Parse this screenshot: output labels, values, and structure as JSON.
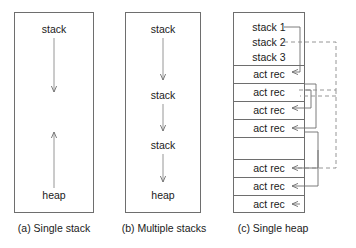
{
  "figure": {
    "background": "#ffffff",
    "line_color": "#6e6e6e",
    "text_color": "#1a1a1a"
  },
  "panels": [
    {
      "id": "a",
      "caption": "(a) Single stack",
      "labels": [
        {
          "name": "stack-label-a1",
          "text": "stack"
        },
        {
          "name": "heap-label-a",
          "text": "heap"
        }
      ],
      "arrows": [
        {
          "name": "arrow-stack-down",
          "direction": "down"
        },
        {
          "name": "arrow-heap-up",
          "direction": "up"
        }
      ]
    },
    {
      "id": "b",
      "caption": "(b) Multiple stacks",
      "labels": [
        {
          "name": "stack-label-b1",
          "text": "stack"
        },
        {
          "name": "stack-label-b2",
          "text": "stack"
        },
        {
          "name": "stack-label-b3",
          "text": "stack"
        },
        {
          "name": "heap-label-b",
          "text": "heap"
        }
      ],
      "arrows": [
        {
          "name": "arrow-b1-down",
          "direction": "down"
        },
        {
          "name": "arrow-b2-down",
          "direction": "down"
        },
        {
          "name": "arrow-b3-down",
          "direction": "down"
        }
      ]
    },
    {
      "id": "c",
      "caption": "(c) Single heap",
      "rows": [
        {
          "name": "row-stack-1",
          "text": "stack 1"
        },
        {
          "name": "row-stack-2",
          "text": "stack 2"
        },
        {
          "name": "row-stack-3",
          "text": "stack 3"
        },
        {
          "name": "row-act-rec-1",
          "text": "act rec"
        },
        {
          "name": "row-act-rec-2",
          "text": "act rec"
        },
        {
          "name": "row-act-rec-3",
          "text": "act rec"
        },
        {
          "name": "row-act-rec-4",
          "text": "act rec"
        },
        {
          "name": "row-empty",
          "text": ""
        },
        {
          "name": "row-act-rec-5",
          "text": "act rec"
        },
        {
          "name": "row-act-rec-6",
          "text": "act rec"
        },
        {
          "name": "row-act-rec-7",
          "text": "act rec"
        }
      ],
      "connectors": {
        "solid_label": "stack 1 chain",
        "dashed_label": "stack 2 chain"
      }
    }
  ]
}
